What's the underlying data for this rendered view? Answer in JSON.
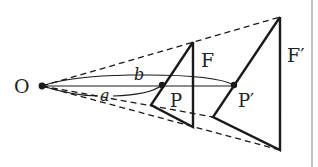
{
  "diagram": {
    "labels": {
      "origin": "O",
      "figure_small": "F",
      "figure_large": "F′",
      "point_small": "P",
      "point_large": "P′",
      "dist_a": "a",
      "dist_b": "b"
    },
    "colors": {
      "stroke": "#1a1a1a",
      "border": "#888888",
      "background": "#ffffff"
    }
  }
}
